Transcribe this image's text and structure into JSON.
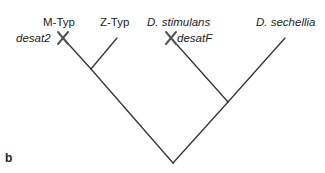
{
  "panel_label": "b",
  "diagram": {
    "type": "phylogenetic-tree",
    "taxa": [
      {
        "id": "m-typ",
        "label": "M-Typ",
        "italic": false,
        "gene_loss": "desat2"
      },
      {
        "id": "z-typ",
        "label": "Z-Typ",
        "italic": false
      },
      {
        "id": "d-stimulans",
        "label": "D. stimulans",
        "italic": true,
        "gene_loss": "desatF"
      },
      {
        "id": "d-sechellia",
        "label": "D. sechellia",
        "italic": true
      }
    ],
    "loss_marker": "X",
    "line_color": "#333333"
  }
}
